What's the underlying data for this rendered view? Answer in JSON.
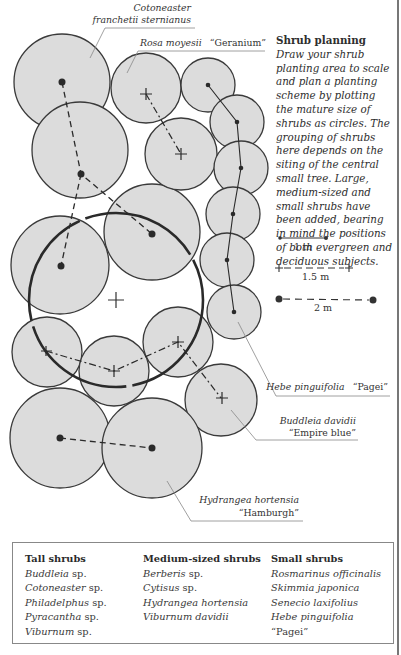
{
  "description": {
    "heading": "Shrub planning",
    "body": "Draw your shrub planting area to scale and plan a planting scheme by plotting the mature size of shrubs as circles. The grouping of shrubs here depends on the siting of the central small tree. Large, medium-sized and small shrubs have been added, bearing in mind the positions of both evergreen and deciduous subjects."
  },
  "scale_key": [
    {
      "label": "1 m",
      "marker": "dot-small",
      "line": "solid"
    },
    {
      "label": "1.5 m",
      "marker": "cross",
      "line": "dashed"
    },
    {
      "label": "2 m",
      "marker": "dot-large",
      "line": "dashed"
    }
  ],
  "callouts": {
    "cotoneaster_line1": "Cotoneaster",
    "cotoneaster_line2": "franchetii sternianus",
    "rosa_italic": "Rosa moyesii",
    "rosa_cultivar": "“Geranium”",
    "hebe_italic": "Hebe pinguifolia",
    "hebe_cultivar": "“Pagei”",
    "buddleia_line1": "Buddleia davidii",
    "buddleia_line2": "“Empire blue”",
    "hydrangea_line1": "Hydrangea hortensia",
    "hydrangea_line2": "“Hamburgh”"
  },
  "legend": {
    "tall": {
      "title": "Tall shrubs",
      "items": [
        {
          "genus": "Buddleia",
          "suffix": "sp."
        },
        {
          "genus": "Cotoneaster",
          "suffix": "sp."
        },
        {
          "genus": "Philadelphus",
          "suffix": "sp."
        },
        {
          "genus": "Pyracantha",
          "suffix": "sp."
        },
        {
          "genus": "Viburnum",
          "suffix": "sp."
        }
      ]
    },
    "medium": {
      "title": "Medium-sized shrubs",
      "items": [
        {
          "genus": "Berberis",
          "suffix": "sp."
        },
        {
          "genus": "Cytisus",
          "suffix": "sp."
        },
        {
          "genus": "Hydrangea hortensia",
          "suffix": ""
        },
        {
          "genus": "Viburnum davidii",
          "suffix": ""
        }
      ]
    },
    "small": {
      "title": "Small shrubs",
      "items": [
        {
          "genus": "Rosmarinus officinalis",
          "suffix": ""
        },
        {
          "genus": "Skimmia japonica",
          "suffix": ""
        },
        {
          "genus": "Senecio laxifolius",
          "suffix": ""
        },
        {
          "genus": "Hebe pinguifolia",
          "suffix": "“Pagei”"
        }
      ]
    }
  }
}
